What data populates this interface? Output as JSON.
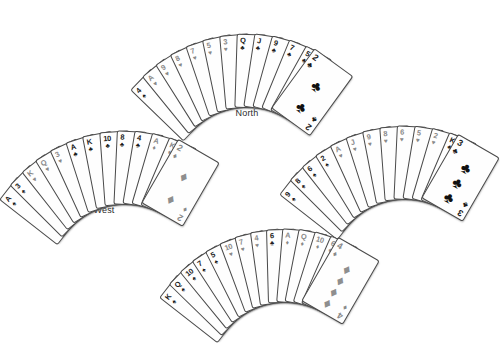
{
  "diagram": {
    "background_color": "#ffffff",
    "card_face_color": "#fefefe",
    "card_border_color": "#4a4a4a",
    "black_suit_color": "#1a1a1a",
    "red_suit_color": "#8a8a8a"
  },
  "suits": {
    "spade": "♠",
    "heart": "♥",
    "diamond": "♦",
    "club": "♣"
  },
  "hands": {
    "north": {
      "label": "North",
      "card_count": 13,
      "cards": [
        {
          "rank": "4",
          "suit": "spade",
          "color": "black"
        },
        {
          "rank": "A",
          "suit": "heart",
          "color": "red"
        },
        {
          "rank": "9",
          "suit": "heart",
          "color": "red"
        },
        {
          "rank": "8",
          "suit": "heart",
          "color": "red"
        },
        {
          "rank": "7",
          "suit": "heart",
          "color": "red"
        },
        {
          "rank": "5",
          "suit": "heart",
          "color": "red"
        },
        {
          "rank": "3",
          "suit": "heart",
          "color": "red"
        },
        {
          "rank": "Q",
          "suit": "club",
          "color": "black"
        },
        {
          "rank": "J",
          "suit": "club",
          "color": "black"
        },
        {
          "rank": "9",
          "suit": "club",
          "color": "black"
        },
        {
          "rank": "7",
          "suit": "club",
          "color": "black"
        },
        {
          "rank": "5",
          "suit": "club",
          "color": "black"
        },
        {
          "rank": "2",
          "suit": "club",
          "color": "black"
        }
      ],
      "lead_card": {
        "rank": "2",
        "suit": "club",
        "color": "black",
        "pip_count": 2
      }
    },
    "west": {
      "label": "West",
      "card_count": 13,
      "cards": [
        {
          "rank": "A",
          "suit": "spade",
          "color": "black"
        },
        {
          "rank": "3",
          "suit": "spade",
          "color": "black"
        },
        {
          "rank": "K",
          "suit": "heart",
          "color": "red"
        },
        {
          "rank": "Q",
          "suit": "heart",
          "color": "red"
        },
        {
          "rank": "3",
          "suit": "heart",
          "color": "red"
        },
        {
          "rank": "A",
          "suit": "club",
          "color": "black"
        },
        {
          "rank": "K",
          "suit": "club",
          "color": "black"
        },
        {
          "rank": "10",
          "suit": "club",
          "color": "black"
        },
        {
          "rank": "8",
          "suit": "club",
          "color": "black"
        },
        {
          "rank": "4",
          "suit": "club",
          "color": "black"
        },
        {
          "rank": "A",
          "suit": "diamond",
          "color": "red"
        },
        {
          "rank": "K",
          "suit": "diamond",
          "color": "red"
        },
        {
          "rank": "2",
          "suit": "diamond",
          "color": "red"
        }
      ],
      "lead_card": {
        "rank": "2",
        "suit": "diamond",
        "color": "red",
        "pip_count": 2
      }
    },
    "east": {
      "label": "East",
      "card_count": 13,
      "cards": [
        {
          "rank": "9",
          "suit": "spade",
          "color": "black"
        },
        {
          "rank": "8",
          "suit": "spade",
          "color": "black"
        },
        {
          "rank": "6",
          "suit": "spade",
          "color": "black"
        },
        {
          "rank": "2",
          "suit": "spade",
          "color": "black"
        },
        {
          "rank": "A",
          "suit": "heart",
          "color": "red"
        },
        {
          "rank": "J",
          "suit": "heart",
          "color": "red"
        },
        {
          "rank": "9",
          "suit": "heart",
          "color": "red"
        },
        {
          "rank": "8",
          "suit": "heart",
          "color": "red"
        },
        {
          "rank": "6",
          "suit": "heart",
          "color": "red"
        },
        {
          "rank": "5",
          "suit": "heart",
          "color": "red"
        },
        {
          "rank": "2",
          "suit": "heart",
          "color": "red"
        },
        {
          "rank": "K",
          "suit": "club",
          "color": "black"
        },
        {
          "rank": "3",
          "suit": "club",
          "color": "black"
        }
      ],
      "lead_card": {
        "rank": "3",
        "suit": "club",
        "color": "black",
        "pip_count": 3
      }
    },
    "south": {
      "label": "South",
      "card_count": 13,
      "cards": [
        {
          "rank": "K",
          "suit": "spade",
          "color": "black"
        },
        {
          "rank": "Q",
          "suit": "spade",
          "color": "black"
        },
        {
          "rank": "10",
          "suit": "spade",
          "color": "black"
        },
        {
          "rank": "7",
          "suit": "spade",
          "color": "black"
        },
        {
          "rank": "5",
          "suit": "spade",
          "color": "black"
        },
        {
          "rank": "10",
          "suit": "heart",
          "color": "red"
        },
        {
          "rank": "7",
          "suit": "heart",
          "color": "red"
        },
        {
          "rank": "4",
          "suit": "heart",
          "color": "red"
        },
        {
          "rank": "6",
          "suit": "club",
          "color": "black"
        },
        {
          "rank": "A",
          "suit": "diamond",
          "color": "red"
        },
        {
          "rank": "Q",
          "suit": "diamond",
          "color": "red"
        },
        {
          "rank": "10",
          "suit": "diamond",
          "color": "red"
        },
        {
          "rank": "6",
          "suit": "diamond",
          "color": "red"
        },
        {
          "rank": "4",
          "suit": "diamond",
          "color": "red"
        }
      ],
      "lead_card": {
        "rank": "4",
        "suit": "diamond",
        "color": "red",
        "pip_count": 4
      }
    }
  }
}
